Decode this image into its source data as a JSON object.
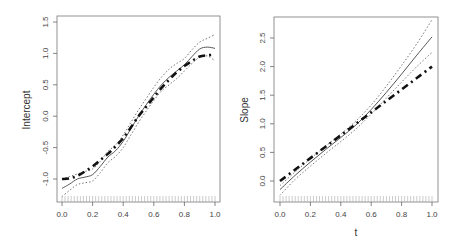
{
  "chart_data": [
    {
      "type": "line",
      "panel": "left",
      "title": "",
      "xlabel": "",
      "ylabel": "Intercept",
      "xlim": [
        0.0,
        1.0
      ],
      "ylim": [
        -1.35,
        1.55
      ],
      "xticks": [
        "0.0",
        "0.2",
        "0.4",
        "0.6",
        "0.8",
        "1.0"
      ],
      "yticks": [
        "-1.0",
        "-0.5",
        "0.0",
        "0.5",
        "1.0",
        "1.5"
      ],
      "grid": false,
      "rug": true,
      "x": [
        0.0,
        0.05,
        0.1,
        0.15,
        0.2,
        0.25,
        0.3,
        0.35,
        0.4,
        0.45,
        0.5,
        0.55,
        0.6,
        0.65,
        0.7,
        0.75,
        0.8,
        0.85,
        0.9,
        0.95,
        1.0
      ],
      "series": [
        {
          "name": "estimate",
          "style": "solid",
          "values": [
            -1.15,
            -1.08,
            -1.0,
            -0.97,
            -0.93,
            -0.8,
            -0.65,
            -0.55,
            -0.4,
            -0.2,
            0.0,
            0.18,
            0.35,
            0.5,
            0.62,
            0.72,
            0.82,
            0.95,
            1.07,
            1.1,
            1.08
          ]
        },
        {
          "name": "upper band",
          "style": "dotted",
          "values": [
            -1.0,
            -0.96,
            -0.92,
            -0.88,
            -0.84,
            -0.72,
            -0.56,
            -0.46,
            -0.3,
            -0.1,
            0.1,
            0.28,
            0.46,
            0.62,
            0.75,
            0.84,
            0.92,
            1.06,
            1.18,
            1.24,
            1.3
          ]
        },
        {
          "name": "lower band",
          "style": "dotted",
          "values": [
            -1.28,
            -1.18,
            -1.09,
            -1.06,
            -1.03,
            -0.9,
            -0.74,
            -0.64,
            -0.5,
            -0.3,
            -0.1,
            0.08,
            0.25,
            0.4,
            0.5,
            0.6,
            0.72,
            0.84,
            0.94,
            0.96,
            0.88
          ]
        },
        {
          "name": "true function",
          "style": "dash-dot-thick",
          "values": [
            -1.0,
            -0.99,
            -0.95,
            -0.88,
            -0.8,
            -0.7,
            -0.6,
            -0.48,
            -0.35,
            -0.18,
            0.0,
            0.15,
            0.3,
            0.45,
            0.58,
            0.7,
            0.8,
            0.88,
            0.95,
            0.97,
            0.98
          ]
        }
      ]
    },
    {
      "type": "line",
      "panel": "right",
      "title": "",
      "xlabel": "t",
      "ylabel": "Slope",
      "xlim": [
        0.0,
        1.0
      ],
      "ylim": [
        -0.35,
        2.85
      ],
      "xticks": [
        "0.0",
        "0.2",
        "0.4",
        "0.6",
        "0.8",
        "1.0"
      ],
      "yticks": [
        "0.0",
        "0.5",
        "1.0",
        "1.5",
        "2.0",
        "2.5"
      ],
      "grid": false,
      "rug": true,
      "x": [
        0.0,
        0.1,
        0.2,
        0.3,
        0.4,
        0.5,
        0.6,
        0.7,
        0.8,
        0.9,
        1.0
      ],
      "series": [
        {
          "name": "estimate",
          "style": "solid",
          "values": [
            -0.15,
            0.1,
            0.33,
            0.55,
            0.76,
            0.98,
            1.25,
            1.55,
            1.87,
            2.2,
            2.52
          ]
        },
        {
          "name": "upper band",
          "style": "dotted",
          "values": [
            -0.08,
            0.16,
            0.39,
            0.61,
            0.82,
            1.05,
            1.33,
            1.66,
            2.02,
            2.4,
            2.82
          ]
        },
        {
          "name": "lower band",
          "style": "dotted",
          "values": [
            -0.25,
            0.03,
            0.26,
            0.48,
            0.69,
            0.91,
            1.17,
            1.45,
            1.73,
            2.0,
            2.25
          ]
        },
        {
          "name": "true function",
          "style": "dash-dot-thick",
          "values": [
            0.0,
            0.2,
            0.4,
            0.6,
            0.8,
            1.0,
            1.2,
            1.4,
            1.6,
            1.8,
            2.0
          ]
        }
      ]
    }
  ],
  "panels": {
    "left": {
      "ylabel": "Intercept",
      "xlabel": ""
    },
    "right": {
      "ylabel": "Slope",
      "xlabel": "t"
    }
  }
}
